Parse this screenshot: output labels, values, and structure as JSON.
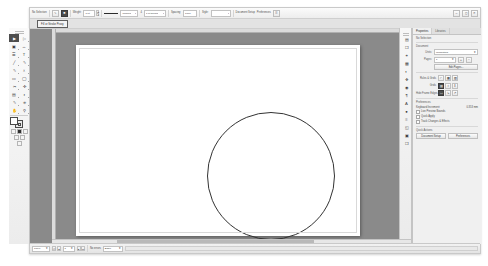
{
  "app": {
    "title": "Adobe InDesign"
  },
  "control_bar": {
    "tool_label": "No Selection",
    "items": [
      {
        "name": "pen-tool-icon",
        "glyph": "✒"
      },
      {
        "name": "fill-swatch-icon",
        "glyph": "■"
      },
      {
        "name": "stroke-weight-label",
        "label": "Weight:"
      },
      {
        "name": "stroke-weight-value",
        "value": "1 pt"
      },
      {
        "name": "stroke-style-preview",
        "label": ""
      },
      {
        "name": "stroke-style-value",
        "value": "Uniform"
      },
      {
        "name": "opacity-label",
        "label": "4"
      },
      {
        "name": "opacity-value",
        "value": "1 pt Round"
      },
      {
        "name": "spacing-label",
        "label": "Spacing:"
      },
      {
        "name": "spacing-value",
        "value": "1000"
      },
      {
        "name": "style-label",
        "label": "Style:"
      },
      {
        "name": "style-value",
        "value": ""
      },
      {
        "name": "document-setup-button",
        "label": "Document Setup"
      },
      {
        "name": "preferences-button",
        "label": "Preferences"
      }
    ],
    "weight_label": "Weight:",
    "weight_value": "1 pt",
    "stroke_type": "Uniform",
    "corner_value": "1 pt Round",
    "spacing_label": "Spacing:",
    "spacing_value": "1000",
    "style_label": "Style:",
    "style_value": "",
    "doc_setup": "Document Setup",
    "preferences": "Preferences",
    "corner_count": "4"
  },
  "tooltip": {
    "text": "Fill or Stroke Proxy"
  },
  "tools": {
    "items": [
      {
        "name": "selection-tool",
        "glyph": "▶",
        "active": true
      },
      {
        "name": "direct-selection-tool",
        "glyph": "▷",
        "active": false
      },
      {
        "name": "page-tool",
        "glyph": "▧",
        "active": false
      },
      {
        "name": "gap-tool",
        "glyph": "↔",
        "active": false
      },
      {
        "name": "content-collector-tool",
        "glyph": "☰",
        "active": false
      },
      {
        "name": "type-tool",
        "glyph": "T",
        "active": false
      },
      {
        "name": "line-tool",
        "glyph": "╲",
        "active": false
      },
      {
        "name": "pen-tool",
        "glyph": "✒",
        "active": false
      },
      {
        "name": "pencil-tool",
        "glyph": "✎",
        "active": false
      },
      {
        "name": "rectangle-frame-tool",
        "glyph": "⌧",
        "active": false
      },
      {
        "name": "rectangle-tool",
        "glyph": "▭",
        "active": false
      },
      {
        "name": "scissors-tool",
        "glyph": "✂",
        "active": false
      },
      {
        "name": "free-transform-tool",
        "glyph": "✣",
        "active": false
      },
      {
        "name": "gradient-swatch-tool",
        "glyph": "▤",
        "active": false
      },
      {
        "name": "gradient-feather-tool",
        "glyph": "◑",
        "active": false
      },
      {
        "name": "note-tool",
        "glyph": "✏",
        "active": false
      },
      {
        "name": "eyedropper-tool",
        "glyph": "⚗",
        "active": false
      },
      {
        "name": "measure-tool",
        "glyph": "⌕",
        "active": false
      },
      {
        "name": "hand-tool",
        "glyph": "✋",
        "active": false
      },
      {
        "name": "zoom-tool",
        "glyph": "⚲",
        "active": false
      }
    ],
    "mini_buttons": [
      {
        "name": "normal-mode-button",
        "dark": false
      },
      {
        "name": "preview-mode-button",
        "dark": true
      },
      {
        "name": "bleed-mode-button",
        "dark": false
      },
      {
        "name": "presentation-mode-button",
        "dark": false
      }
    ]
  },
  "dock": {
    "items": [
      {
        "name": "pages-panel-icon",
        "glyph": "▤"
      },
      {
        "name": "layers-panel-icon",
        "glyph": "❐"
      },
      {
        "name": "links-panel-icon",
        "glyph": "⚭"
      },
      {
        "name": "stroke-panel-icon",
        "glyph": "▦"
      },
      {
        "name": "color-panel-icon",
        "glyph": "◐"
      },
      {
        "name": "swatches-panel-icon",
        "glyph": "❖"
      },
      {
        "name": "effects-panel-icon",
        "glyph": "◉"
      },
      {
        "name": "paragraph-styles-panel-icon",
        "glyph": "¶"
      },
      {
        "name": "character-styles-panel-icon",
        "glyph": "A"
      },
      {
        "name": "object-styles-panel-icon",
        "glyph": "●"
      },
      {
        "name": "align-panel-icon",
        "glyph": "≡"
      },
      {
        "name": "transform-panel-icon",
        "glyph": "◱"
      },
      {
        "name": "text-wrap-panel-icon",
        "glyph": "▣"
      },
      {
        "name": "library-panel-icon",
        "glyph": "❒"
      }
    ]
  },
  "properties": {
    "tabs": [
      {
        "name": "tab-properties",
        "label": "Properties",
        "active": true
      },
      {
        "name": "tab-libraries",
        "label": "Libraries",
        "active": false
      }
    ],
    "no_selection": "No Selection",
    "document_header": "Document",
    "units_label": "Units:",
    "units_value": "Millimeters",
    "pages_label": "Pages:",
    "pages_value": "1",
    "edit_pages_button": "Edit Pages...",
    "rulers_header": "Rules & Grids",
    "grids_header": "Grids",
    "hide_rulers_icons": [
      {
        "name": "show-rulers-icon",
        "glyph": "⌐",
        "dark": false
      },
      {
        "name": "show-grid-icon",
        "glyph": "▦",
        "dark": false
      },
      {
        "name": "show-guides-icon",
        "glyph": "▨",
        "dark": false
      }
    ],
    "guides_icons": [
      {
        "name": "smart-guides-icon",
        "glyph": "▤",
        "dark": true
      },
      {
        "name": "lock-guides-icon",
        "glyph": "⚿",
        "dark": false
      },
      {
        "name": "lock-column-guides-icon",
        "glyph": "‖",
        "dark": false
      }
    ],
    "frame_icons": [
      {
        "name": "hide-frame-edges-icon",
        "glyph": "▭",
        "dark": true
      },
      {
        "name": "show-text-threads-icon",
        "glyph": "↳",
        "dark": false
      },
      {
        "name": "show-assigned-frames-icon",
        "glyph": "↱",
        "dark": false
      }
    ],
    "frame_edges_header": "Hide Frame Edges",
    "preferences_header": "Preferences",
    "keyboard_increment_label": "Keyboard Increment:",
    "keyboard_increment_value": "0.353 mm",
    "checkboxes": [
      {
        "name": "checkbox-live-preview-bounds",
        "label": "Live Preview Bounds"
      },
      {
        "name": "checkbox-quick-apply",
        "label": "Quick Apply"
      },
      {
        "name": "checkbox-track-changes",
        "label": "Track Changes & Effects"
      }
    ],
    "quick_actions_header": "Quick Actions",
    "buttons": [
      {
        "name": "document-setup-button",
        "label": "Document Setup"
      },
      {
        "name": "preferences-button",
        "label": "Preferences"
      }
    ]
  },
  "canvas": {
    "shape_name": "circle-shape",
    "stroke_color": "#333333"
  },
  "status_bar": {
    "zoom_value": "100%",
    "page_value": "1",
    "page_nav": [
      "⏮",
      "◀",
      "▶",
      "⏭"
    ],
    "status_text": "No errors",
    "preflight_text": "Basic"
  },
  "window_controls": [
    {
      "name": "minimize-button",
      "glyph": "–"
    },
    {
      "name": "maximize-button",
      "glyph": "□"
    },
    {
      "name": "close-button",
      "glyph": "✕"
    }
  ],
  "colors": {
    "pasteboard": "#8a8a8a",
    "panel": "#f0f0f0",
    "accent": "#4d4d4d"
  }
}
